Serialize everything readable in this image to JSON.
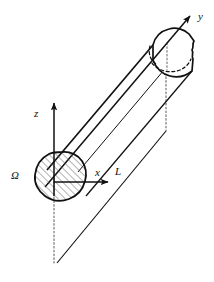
{
  "figure": {
    "type": "technical-line-diagram",
    "background_color": "#ffffff",
    "stroke_color": "#111111",
    "hatch_color": "#555555",
    "dotted_color": "#666666"
  },
  "labels": {
    "axis_y": "y",
    "axis_z": "z",
    "axis_x": "x",
    "length": "L",
    "cross_section": "Ω"
  },
  "axes": {
    "y": {
      "label": "y",
      "direction": "up-right",
      "arrow_tip": [
        193,
        13
      ],
      "origin": [
        62,
        180
      ]
    },
    "z": {
      "label": "z",
      "direction": "up",
      "arrow_tip": [
        54,
        101
      ],
      "origin": [
        54,
        195
      ]
    },
    "x": {
      "label": "x",
      "direction": "right",
      "arrow_tip": [
        110,
        182
      ],
      "origin": [
        62,
        182
      ]
    }
  },
  "geometry": {
    "near_cap_center": [
      63,
      180
    ],
    "far_cap_center": [
      173,
      52
    ],
    "length_line_start": [
      57,
      263
    ],
    "length_line_end": [
      165,
      131
    ],
    "drop_line_origin": [
      54,
      180
    ],
    "drop_line_bottom": [
      54,
      263
    ],
    "drop_line_far_top": [
      166,
      52
    ],
    "drop_line_far_bottom": [
      166,
      131
    ]
  }
}
